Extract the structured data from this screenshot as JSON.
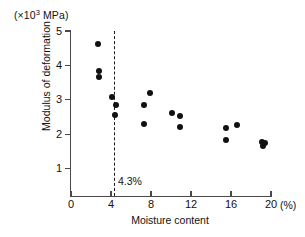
{
  "chart_data": {
    "type": "scatter",
    "title": "",
    "xlabel": "Moisture content",
    "xunit": "(%)",
    "ylabel": "Modulus of deformation",
    "yunit_prefix": "(×10",
    "yunit_exponent": "3",
    "yunit_suffix": " MPa)",
    "xlim": [
      0,
      20
    ],
    "ylim": [
      0,
      5
    ],
    "xticks": [
      0,
      4,
      8,
      12,
      16,
      20
    ],
    "yticks": [
      1,
      2,
      3,
      4,
      5
    ],
    "xtick_labels": [
      "0",
      "4",
      "8",
      "12",
      "16",
      "20"
    ],
    "ytick_labels": [
      "1",
      "2",
      "3",
      "4",
      "5"
    ],
    "grid": false,
    "legend": false,
    "annotations": [
      {
        "name": "threshold-4.3",
        "label": "4.3%",
        "x": 4.3,
        "style": "vertical-dashed-line"
      }
    ],
    "points": [
      {
        "x": 2.7,
        "y": 4.63
      },
      {
        "x": 2.8,
        "y": 3.85
      },
      {
        "x": 2.8,
        "y": 3.67
      },
      {
        "x": 4.1,
        "y": 3.08
      },
      {
        "x": 4.5,
        "y": 2.85
      },
      {
        "x": 4.4,
        "y": 2.55
      },
      {
        "x": 7.9,
        "y": 3.2
      },
      {
        "x": 7.3,
        "y": 2.85
      },
      {
        "x": 7.3,
        "y": 2.3
      },
      {
        "x": 10.1,
        "y": 2.62
      },
      {
        "x": 10.9,
        "y": 2.53
      },
      {
        "x": 10.9,
        "y": 2.22
      },
      {
        "x": 15.5,
        "y": 2.18
      },
      {
        "x": 15.5,
        "y": 1.83
      },
      {
        "x": 16.6,
        "y": 2.27
      },
      {
        "x": 19.1,
        "y": 1.78
      },
      {
        "x": 19.4,
        "y": 1.74
      },
      {
        "x": 19.2,
        "y": 1.66
      }
    ],
    "marker": {
      "shape": "circle",
      "color": "#111111",
      "size": 6
    },
    "axis_color": "#4a4a4a"
  }
}
